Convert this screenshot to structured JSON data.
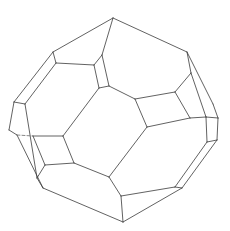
{
  "figure": {
    "type": "crystal-polyhedron-line-drawing",
    "stroke_color": "#3a3a3a",
    "background": "#ffffff",
    "vertices": {
      "T": [
        113,
        18
      ],
      "A": [
        53,
        52
      ],
      "B": [
        56,
        63
      ],
      "C": [
        94,
        65
      ],
      "D": [
        102,
        55
      ],
      "E": [
        187,
        52
      ],
      "F": [
        191,
        73
      ],
      "G": [
        14,
        102
      ],
      "H": [
        25,
        104
      ],
      "I": [
        99,
        88
      ],
      "J": [
        109,
        86
      ],
      "K": [
        135,
        99
      ],
      "L": [
        175,
        92
      ],
      "M": [
        213,
        104
      ],
      "N": [
        218,
        118
      ],
      "O": [
        206,
        117
      ],
      "P": [
        190,
        118
      ],
      "Q": [
        147,
        127
      ],
      "S": [
        9,
        130
      ],
      "U": [
        17,
        135
      ],
      "V": [
        33,
        136
      ],
      "W": [
        63,
        136
      ],
      "X": [
        207,
        142
      ],
      "Y": [
        217,
        140
      ],
      "Z": [
        74,
        163
      ],
      "AA": [
        45,
        165
      ],
      "AB": [
        37,
        178
      ],
      "AC": [
        43,
        188
      ],
      "AD": [
        109,
        177
      ],
      "AE": [
        121,
        196
      ],
      "AF": [
        123,
        222
      ],
      "AG": [
        175,
        187
      ],
      "AH": [
        182,
        188
      ]
    },
    "edges": [
      [
        "T",
        "A"
      ],
      [
        "T",
        "D"
      ],
      [
        "T",
        "E"
      ],
      [
        "A",
        "B"
      ],
      [
        "A",
        "G"
      ],
      [
        "B",
        "C"
      ],
      [
        "B",
        "H"
      ],
      [
        "C",
        "D"
      ],
      [
        "C",
        "I"
      ],
      [
        "D",
        "J"
      ],
      [
        "I",
        "J"
      ],
      [
        "I",
        "W"
      ],
      [
        "J",
        "K"
      ],
      [
        "K",
        "L"
      ],
      [
        "K",
        "Q"
      ],
      [
        "L",
        "F"
      ],
      [
        "E",
        "F"
      ],
      [
        "E",
        "M"
      ],
      [
        "F",
        "O"
      ],
      [
        "L",
        "P"
      ],
      [
        "Q",
        "P"
      ],
      [
        "P",
        "O"
      ],
      [
        "O",
        "N"
      ],
      [
        "M",
        "N"
      ],
      [
        "N",
        "Y"
      ],
      [
        "O",
        "X"
      ],
      [
        "X",
        "Y"
      ],
      [
        "X",
        "AG"
      ],
      [
        "Y",
        "AH"
      ],
      [
        "AG",
        "AH"
      ],
      [
        "AG",
        "AE"
      ],
      [
        "AH",
        "AF"
      ],
      [
        "Q",
        "AD"
      ],
      [
        "AD",
        "AE"
      ],
      [
        "AE",
        "AF"
      ],
      [
        "AD",
        "Z"
      ],
      [
        "Z",
        "W"
      ],
      [
        "W",
        "V"
      ],
      [
        "Z",
        "AA"
      ],
      [
        "AA",
        "AB"
      ],
      [
        "AA",
        "V"
      ],
      [
        "AB",
        "AC"
      ],
      [
        "AC",
        "AF"
      ],
      [
        "G",
        "H"
      ],
      [
        "G",
        "S"
      ],
      [
        "H",
        "AB"
      ],
      [
        "S",
        "U"
      ],
      [
        "U",
        "AC"
      ]
    ],
    "dashed_edges": [
      [
        "U",
        "V"
      ]
    ]
  }
}
